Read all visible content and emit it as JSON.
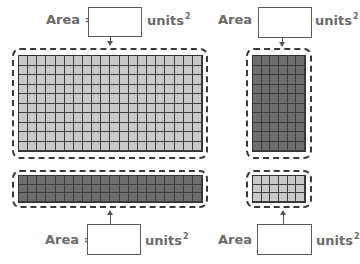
{
  "labels": {
    "area_prefix": "Area =",
    "units": "units",
    "units_exponent": "2"
  },
  "colors": {
    "light_cell": "#c9c9c9",
    "dark_cell": "#6e6e6e",
    "grid_line": "#3d3d3d",
    "label_text": "#6b6b6b"
  },
  "problems": [
    {
      "id": "top-left",
      "grid": {
        "columns": 20,
        "rows": 10,
        "shade": "light"
      },
      "answer": ""
    },
    {
      "id": "top-right",
      "grid": {
        "columns": 6,
        "rows": 10,
        "shade": "dark"
      },
      "answer": ""
    },
    {
      "id": "bottom-left",
      "grid": {
        "columns": 20,
        "rows": 3,
        "shade": "dark"
      },
      "answer": ""
    },
    {
      "id": "bottom-right",
      "grid": {
        "columns": 6,
        "rows": 3,
        "shade": "light"
      },
      "answer": ""
    }
  ]
}
